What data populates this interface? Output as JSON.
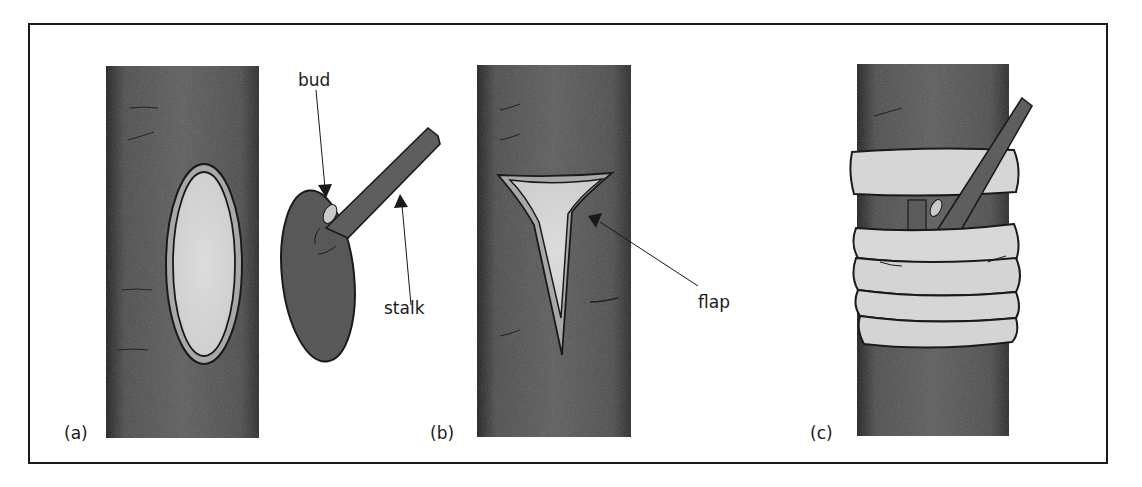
{
  "figure": {
    "panels": [
      {
        "id": "a",
        "label": "(a)",
        "description": "Stem with oval bud-shield cut out"
      },
      {
        "id": "b",
        "label": "(b)",
        "description": "Stem with T-shaped cut and flap; detached bud shield with stalk"
      },
      {
        "id": "c",
        "label": "(c)",
        "description": "Bud shield inserted and bound with tape"
      }
    ],
    "annotations": {
      "bud": "bud",
      "stalk": "stalk",
      "flap": "flap"
    },
    "colors": {
      "bark": "#555555",
      "bark_edge": "#1e1e1e",
      "cut_light": "#d4d4d4",
      "cut_rim": "#a8a8a8",
      "tape": "#d6d6d6",
      "outline": "#1a1a1a"
    }
  }
}
